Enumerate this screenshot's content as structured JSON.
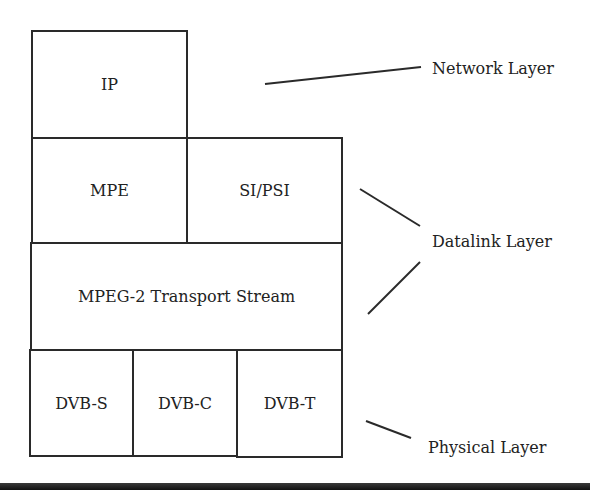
{
  "diagram": {
    "blocks": {
      "ip": "IP",
      "mpe": "MPE",
      "si_psi": "SI/PSI",
      "mpeg2_ts": "MPEG-2 Transport Stream",
      "dvb_s": "DVB-S",
      "dvb_c": "DVB-C",
      "dvb_t": "DVB-T"
    },
    "layers": {
      "network": "Network Layer",
      "datalink": "Datalink Layer",
      "physical": "Physical Layer"
    },
    "colors": {
      "line": "#2a2a2a",
      "text": "#222222",
      "background": "#ffffff"
    }
  }
}
